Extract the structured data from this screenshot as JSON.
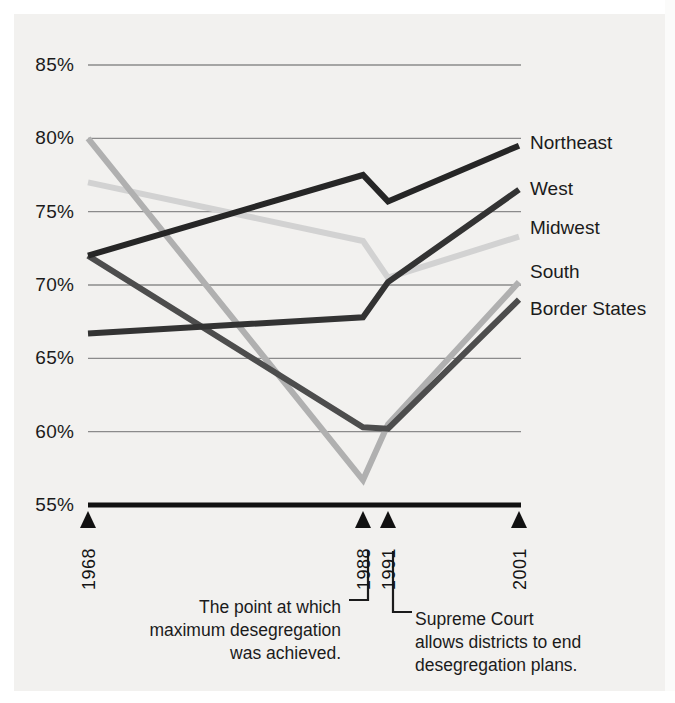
{
  "chart_data": {
    "type": "line",
    "title": "",
    "xlabel": "",
    "ylabel": "",
    "x": [
      1968,
      1988,
      1991,
      2001
    ],
    "xtick_labels": [
      "1968",
      "1988",
      "1991",
      "2001"
    ],
    "ylim": [
      55,
      85
    ],
    "ytick_labels": [
      "85%",
      "80%",
      "75%",
      "70%",
      "65%",
      "60%",
      "55%"
    ],
    "ytick_values": [
      85,
      80,
      75,
      70,
      65,
      60,
      55
    ],
    "grid": "horizontal",
    "legend_position": "right-inline-labels",
    "series": [
      {
        "name": "Northeast",
        "values": [
          72.0,
          77.5,
          75.7,
          79.5
        ],
        "color": "#262626"
      },
      {
        "name": "West",
        "values": [
          66.7,
          67.8,
          70.2,
          76.5
        ],
        "color": "#333333"
      },
      {
        "name": "Midwest",
        "values": [
          77.0,
          73.0,
          70.5,
          73.3
        ],
        "color": "#d2d2d2"
      },
      {
        "name": "South",
        "values": [
          80.0,
          56.7,
          60.5,
          70.2
        ],
        "color": "#b0b0b0"
      },
      {
        "name": "Border States",
        "values": [
          72.0,
          60.3,
          60.2,
          69.0
        ],
        "color": "#4d4d4d"
      }
    ],
    "annotations": [
      {
        "id": "max-desegregation",
        "text": "The point at which\nmaximum desegregation\nwas achieved.",
        "points_to": "1988"
      },
      {
        "id": "supreme-court",
        "text": "Supreme Court\nallows districts to end\ndesegregation plans.",
        "points_to": "1991"
      }
    ]
  },
  "axis": {
    "baseline_color": "#111111",
    "gridline_color": "#8b8b8b",
    "marker_glyph": "▲"
  }
}
